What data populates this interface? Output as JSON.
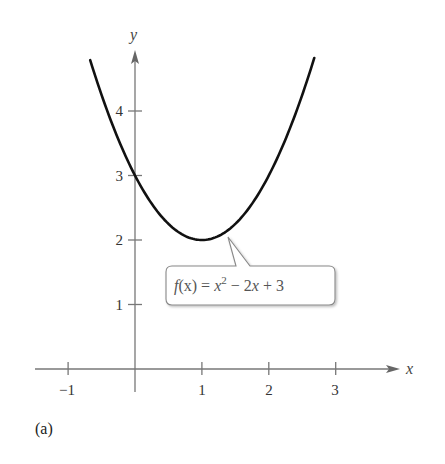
{
  "chart_data": {
    "type": "line",
    "title": "",
    "function": "x^2 - 2x + 3",
    "xlabel": "x",
    "ylabel": "y",
    "xlim": [
      -1.4,
      3.9
    ],
    "ylim": [
      -0.3,
      5.0
    ],
    "x_ticks": [
      -1,
      1,
      2,
      3
    ],
    "x_tick_labels": [
      "−1",
      "1",
      "2",
      "3"
    ],
    "y_ticks": [
      1,
      2,
      3,
      4
    ],
    "y_tick_labels": [
      "1",
      "2",
      "3",
      "4"
    ],
    "grid": false,
    "series": [
      {
        "name": "f(x) = x^2 - 2x + 3",
        "x": [
          -0.67,
          -0.5,
          -0.25,
          0,
          0.25,
          0.5,
          0.75,
          1,
          1.25,
          1.5,
          1.75,
          2,
          2.25,
          2.5,
          2.68
        ],
        "y": [
          4.79,
          4.25,
          3.5625,
          3,
          2.5625,
          2.25,
          2.0625,
          2,
          2.0625,
          2.25,
          2.5625,
          3,
          3.5625,
          4.25,
          4.82
        ]
      }
    ],
    "annotations": [
      {
        "text": "f(x) = x² − 2x + 3",
        "points_to": [
          1.4,
          2.16
        ],
        "style": "callout"
      }
    ],
    "panel_label": "(a)",
    "colors": {
      "curve": "#111111",
      "axis": "#777777",
      "callout_border": "#888888"
    }
  },
  "labels": {
    "x_axis": "x",
    "y_axis": "y",
    "x_ticks": [
      "−1",
      "1",
      "2",
      "3"
    ],
    "y_ticks": [
      "1",
      "2",
      "3",
      "4"
    ],
    "callout_f": "f",
    "callout_x_paren": "(x)",
    "callout_eq": " = ",
    "callout_x": "x",
    "callout_sup": "2",
    "callout_rest_minus": " − 2",
    "callout_rest_x": "x",
    "callout_rest_tail": " + 3",
    "panel": "(a)"
  }
}
